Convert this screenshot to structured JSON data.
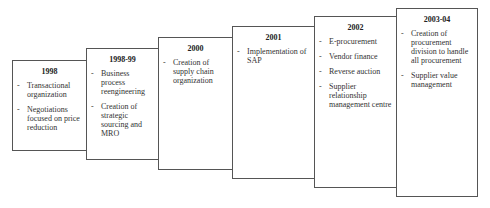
{
  "diagram": {
    "type": "staircase-timeline",
    "stages": [
      {
        "year": "1998",
        "items": [
          "Transactional organization",
          "Negotiations focused on price reduction"
        ]
      },
      {
        "year": "1998-99",
        "items": [
          "Business process reengineering",
          "Creation of strategic sourcing and MRO"
        ]
      },
      {
        "year": "2000",
        "items": [
          "Creation of supply chain organization"
        ]
      },
      {
        "year": "2001",
        "items": [
          "Implementation of SAP"
        ]
      },
      {
        "year": "2002",
        "items": [
          "E-procurement",
          "Vendor finance",
          "Reverse auction",
          "Supplier relationship management centre"
        ]
      },
      {
        "year": "2003-04",
        "items": [
          "Creation of procurement division to handle all procurement",
          "Supplier value management"
        ]
      }
    ],
    "bullet": "-"
  }
}
